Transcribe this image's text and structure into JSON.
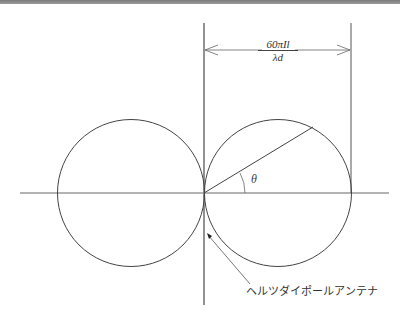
{
  "diagram": {
    "dimension_label": {
      "numerator": "60πIl",
      "denominator": "λd"
    },
    "angle_label": "θ",
    "antenna_label": "ヘルツダイポールアンテナ",
    "colors": {
      "line": "#444444",
      "axis": "#666666",
      "background": "#ffffff"
    },
    "geometry": {
      "origin": [
        204,
        193
      ],
      "left_circle": {
        "cx": 131,
        "cy": 193,
        "r": 74
      },
      "right_circle": {
        "cx": 278,
        "cy": 193,
        "r": 74
      },
      "radius_line_end": [
        313,
        127
      ],
      "dimension_y": 50
    }
  }
}
